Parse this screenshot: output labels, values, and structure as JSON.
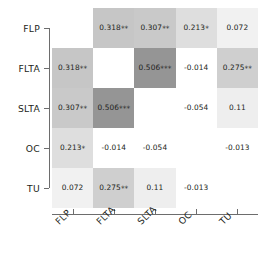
{
  "chart_data": {
    "type": "heatmap",
    "title": "",
    "subtitle": "",
    "xlabel": "",
    "ylabel": "",
    "grid": false,
    "legend": "none",
    "categories": [
      "FLP",
      "FLTA",
      "SLTA",
      "OC",
      "TU"
    ],
    "row_labels": [
      "FLP",
      "FLTA",
      "SLTA",
      "OC",
      "TU"
    ],
    "col_labels": [
      "FLP",
      "FLTA",
      "SLTA",
      "OC",
      "TU"
    ],
    "diagonal": "blank",
    "symmetric": true,
    "values": [
      [
        null,
        0.318,
        0.307,
        0.213,
        0.072
      ],
      [
        0.318,
        null,
        0.506,
        -0.014,
        0.275
      ],
      [
        0.307,
        0.506,
        null,
        -0.054,
        0.11
      ],
      [
        0.213,
        -0.014,
        -0.054,
        null,
        -0.013
      ],
      [
        0.072,
        0.275,
        0.11,
        -0.013,
        null
      ]
    ],
    "cell_text": [
      [
        "",
        "0.318",
        "0.307",
        "0.213",
        "0.072"
      ],
      [
        "0.318",
        "",
        "0.506",
        "-0.014",
        "0.275"
      ],
      [
        "0.307",
        "0.506",
        "",
        "-0.054",
        "0.11"
      ],
      [
        "0.213",
        "-0.014",
        "-0.054",
        "",
        "-0.013"
      ],
      [
        "0.072",
        "0.275",
        "0.11",
        "-0.013",
        ""
      ]
    ],
    "significance_stars": [
      [
        "",
        "**",
        "**",
        "*",
        ""
      ],
      [
        "**",
        "",
        "***",
        "",
        "**"
      ],
      [
        "**",
        "***",
        "",
        "",
        ""
      ],
      [
        "*",
        "",
        "",
        "",
        ""
      ],
      [
        "",
        "**",
        "",
        "",
        ""
      ]
    ],
    "cell_colors": [
      [
        "#ffffff",
        "#c6c6c6",
        "#c9c9c9",
        "#dedede",
        "#f1f1f1"
      ],
      [
        "#c6c6c6",
        "#ffffff",
        "#959595",
        "#ffffff",
        "#cfcfcf"
      ],
      [
        "#c9c9c9",
        "#959595",
        "#ffffff",
        "#ffffff",
        "#eeeeee"
      ],
      [
        "#dedede",
        "#ffffff",
        "#ffffff",
        "#ffffff",
        "#ffffff"
      ],
      [
        "#f1f1f1",
        "#cfcfcf",
        "#eeeeee",
        "#ffffff",
        "#ffffff"
      ]
    ],
    "colorscale": {
      "low": "#ffffff",
      "high": "#959595",
      "note": "grey shading increases with positive correlation magnitude; non-positive values unshaded"
    },
    "axis_color": "#6d6d6d",
    "text_color": "#231f20"
  }
}
